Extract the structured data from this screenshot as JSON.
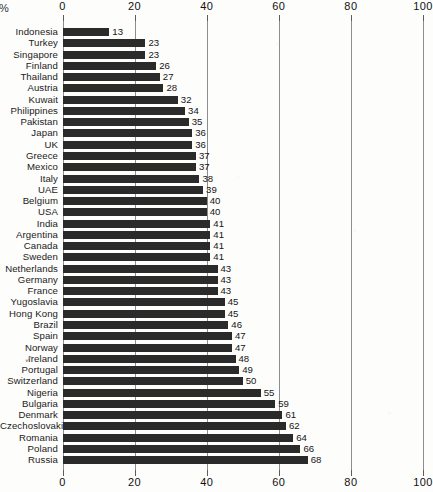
{
  "chart_data": {
    "type": "bar",
    "orientation": "horizontal",
    "title": "",
    "xlabel": "%",
    "ylabel": "",
    "xlim": [
      0,
      100
    ],
    "xticks": [
      0,
      20,
      40,
      60,
      80,
      100
    ],
    "grid": true,
    "legend": null,
    "axis_label_top": "%",
    "categories": [
      "Indonesia",
      "Turkey",
      "Singapore",
      "Finland",
      "Thailand",
      "Austria",
      "Kuwait",
      "Philippines",
      "Pakistan",
      "Japan",
      "UK",
      "Greece",
      "Mexico",
      "Italy",
      "UAE",
      "Belgium",
      "USA",
      "India",
      "Argentina",
      "Canada",
      "Sweden",
      "Netherlands",
      "Germany",
      "France",
      "Yugoslavia",
      "Hong Kong",
      "Brazil",
      "Spain",
      "Norway",
      "Ireland",
      "Portugal",
      "Switzerland",
      "Nigeria",
      "Bulgaria",
      "Denmark",
      "Czechoslovakia",
      "Romania",
      "Poland",
      "Russia"
    ],
    "values": [
      13,
      23,
      23,
      26,
      27,
      28,
      32,
      34,
      35,
      36,
      36,
      37,
      37,
      38,
      39,
      40,
      40,
      41,
      41,
      41,
      41,
      43,
      43,
      43,
      45,
      45,
      46,
      47,
      47,
      48,
      49,
      50,
      55,
      59,
      61,
      62,
      64,
      66,
      68
    ],
    "bar_color": "#2a2a2a",
    "gridline_color": "#8d8d8d",
    "background_color": "#fdfdfc"
  },
  "annotations": {
    "ireland_checkmark": "✓"
  },
  "axes": {
    "top_ticks": [
      "0",
      "20",
      "40",
      "60",
      "80",
      "100"
    ],
    "bottom_ticks": [
      "0",
      "20",
      "40",
      "60",
      "80",
      "100"
    ]
  }
}
